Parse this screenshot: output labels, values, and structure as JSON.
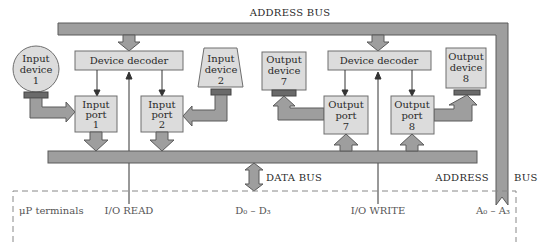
{
  "diagram": {
    "colors": {
      "bus_fill": "#9e9e9e",
      "bus_stroke": "#5a5a5a",
      "box_fill": "#dcdcdc",
      "box_stroke": "#6e6e6e",
      "connector_fill": "#6a6a6a",
      "line": "#333333",
      "dashed": "#888888"
    },
    "buses": {
      "address_bus_top": "ADDRESS BUS",
      "data_bus": "DATA BUS",
      "address_label_left": "ADDRESS",
      "address_label_right": "BUS"
    },
    "decoders": [
      {
        "label": "Device decoder"
      },
      {
        "label": "Device decoder"
      }
    ],
    "devices": [
      {
        "line1": "Input",
        "line2": "device",
        "line3": "1",
        "shape": "circle"
      },
      {
        "line1": "Input",
        "line2": "device",
        "line3": "2",
        "shape": "trapezoid"
      },
      {
        "line1": "Output",
        "line2": "device",
        "line3": "7",
        "shape": "rect"
      },
      {
        "line1": "Output",
        "line2": "device",
        "line3": "8",
        "shape": "rect"
      }
    ],
    "ports": [
      {
        "line1": "Input",
        "line2": "port",
        "line3": "1"
      },
      {
        "line1": "Input",
        "line2": "port",
        "line3": "2"
      },
      {
        "line1": "Output",
        "line2": "port",
        "line3": "7"
      },
      {
        "line1": "Output",
        "line2": "port",
        "line3": "8"
      }
    ],
    "terminals": {
      "title": "μP terminals",
      "io_read": "I/O READ",
      "data_lines": "D₀ – D₃",
      "io_write": "I/O WRITE",
      "address_lines": "A₀ – A₃"
    }
  }
}
